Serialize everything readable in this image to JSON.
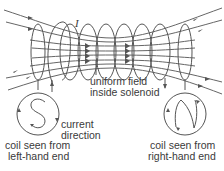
{
  "diagram": {
    "labels": {
      "current_symbol": "I",
      "uniform_field_line1": "uniform field",
      "uniform_field_line2": "inside solenoid",
      "current_direction_line1": "current",
      "current_direction_line2": "direction",
      "left_coil_line1": "coil seen from",
      "left_coil_line2": "left-hand end",
      "right_coil_line1": "coil seen from",
      "right_coil_line2": "right-hand end"
    },
    "left_end_pole_letter": "S",
    "right_end_pole_letter": "N",
    "colors": {
      "line": "#555555",
      "text": "#3a3a3a",
      "background": "#ffffff"
    }
  }
}
